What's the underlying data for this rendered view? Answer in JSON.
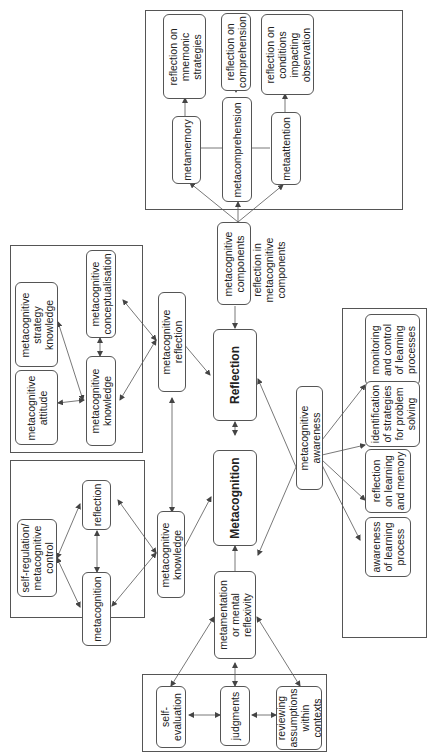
{
  "diagram": {
    "nodes": {
      "reflection": "Reflection",
      "metacognition": "Metacognition",
      "metacognitive_components": "metacognitive\ncomponents",
      "metamemory": "metamemory",
      "metacomprehension": "metacomprehension",
      "metaattention": "metaattention",
      "reflection_mnemonic": "reflection on\nmnemonic\nstrategies",
      "reflection_comprehension": "reflection on\ncomprehension",
      "reflection_conditions": "reflection on\nconditions\nimpacting\nobservation",
      "metacognitive_reflection": "metacognitive\nreflection",
      "mc_knowledge_upper": "metacognitive\nknowledge",
      "mc_conceptualisation": "metacognitive\nconceptualisation",
      "mc_strategy_knowledge": "metacognitive\nstrategy\nknowledge",
      "mc_attitude": "metacognitive\nattitude",
      "metacognitive_knowledge": "metacognitive\nknowledge",
      "self_regulation": "self-regulation/\nmetacognitive\ncontrol",
      "reflection_small": "reflection",
      "metacognition_small": "metacognition",
      "metamentation": "metamentation\nor mental\nreflexivity",
      "self_evaluation": "self-\nevaluation",
      "judgments": "judgments",
      "reviewing_assumptions": "reviewing\nassumptions\nwithin\ncontexts",
      "metacognitive_awareness": "metacognitive\nawareness",
      "monitoring_control": "monitoring\nand control\nof learning\nprocesses",
      "identification_strategies": "identification\nof strategies\nfor problem\nsolving",
      "reflection_learning_memory": "reflection\non learning\nand memory",
      "awareness_learning": "awareness\nof learning\nprocess"
    },
    "annotations": {
      "reflection_in_components": "reflection in\nmetacognitive\ncomponents"
    }
  }
}
